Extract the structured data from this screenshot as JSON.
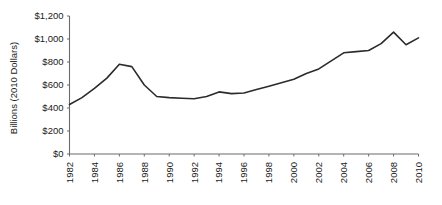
{
  "chart_data": {
    "type": "line",
    "title": "",
    "xlabel": "",
    "ylabel": "Billions (2010 Dollars)",
    "ylim": [
      0,
      1200
    ],
    "ytick_labels": [
      "$0",
      "$200",
      "$400",
      "$600",
      "$800",
      "$1,000",
      "$1,200"
    ],
    "ytick_values": [
      0,
      200,
      400,
      600,
      800,
      1000,
      1200
    ],
    "xlim": [
      1982,
      2010
    ],
    "xtick_labels": [
      "1982",
      "1984",
      "1986",
      "1988",
      "1990",
      "1992",
      "1994",
      "1996",
      "1998",
      "2000",
      "2002",
      "2004",
      "2006",
      "2008",
      "2010"
    ],
    "xtick_values": [
      1982,
      1984,
      1986,
      1988,
      1990,
      1992,
      1994,
      1996,
      1998,
      2000,
      2002,
      2004,
      2006,
      2008,
      2010
    ],
    "grid": false,
    "legend": false,
    "x": [
      1982,
      1983,
      1984,
      1985,
      1986,
      1987,
      1988,
      1989,
      1990,
      1991,
      1992,
      1993,
      1994,
      1995,
      1996,
      1997,
      1998,
      1999,
      2000,
      2001,
      2002,
      2003,
      2004,
      2005,
      2006,
      2007,
      2008,
      2009,
      2010
    ],
    "values": [
      430,
      490,
      570,
      660,
      780,
      760,
      600,
      500,
      490,
      485,
      480,
      500,
      540,
      525,
      530,
      560,
      590,
      620,
      650,
      700,
      740,
      810,
      880,
      890,
      900,
      960,
      1060,
      950,
      1010
    ],
    "series": [
      {
        "name": "",
        "color": "#2b2b2b",
        "values": [
          430,
          490,
          570,
          660,
          780,
          760,
          600,
          500,
          490,
          485,
          480,
          500,
          540,
          525,
          530,
          560,
          590,
          620,
          650,
          700,
          740,
          810,
          880,
          890,
          900,
          960,
          1060,
          950,
          1010
        ]
      }
    ],
    "axis_color": "#6b6b6b",
    "line_color": "#2b2b2b",
    "background": "#ffffff"
  }
}
